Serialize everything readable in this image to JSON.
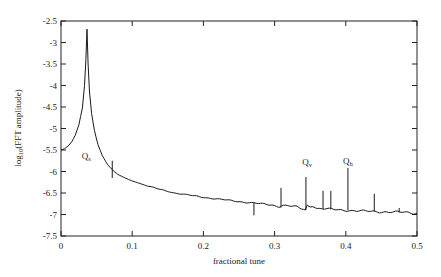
{
  "chart_data": {
    "type": "line",
    "title": "",
    "xlabel": "fractional tune",
    "ylabel": "log10(FFT amplitude)",
    "ylabel_parts": {
      "prefix": "log",
      "sub": "10",
      "suffix": "(FFT amplitude)"
    },
    "xlim": [
      0,
      0.5
    ],
    "ylim": [
      -7.5,
      -2.5
    ],
    "grid": false,
    "legend": null,
    "x_ticks": [
      0,
      0.1,
      0.2,
      0.3,
      0.4,
      0.5
    ],
    "x_tick_labels": [
      "0",
      "0.1",
      "0.2",
      "0.3",
      "0.4",
      "0.5"
    ],
    "y_ticks": [
      -2.5,
      -3,
      -3.5,
      -4,
      -4.5,
      -5,
      -5.5,
      -6,
      -6.5,
      -7,
      -7.5
    ],
    "y_tick_labels": [
      "-2.5",
      "-3",
      "-3.5",
      "-4",
      "-4.5",
      "-5",
      "-5.5",
      "-6",
      "-6.5",
      "-7",
      "-7.5"
    ],
    "series": [
      {
        "name": "FFT spectrum",
        "color": "#1a1a1a",
        "baseline": [
          [
            0,
            -5.5
          ],
          [
            0.005,
            -5.47
          ],
          [
            0.01,
            -5.41
          ],
          [
            0.015,
            -5.31
          ],
          [
            0.02,
            -5.16
          ],
          [
            0.025,
            -4.92
          ],
          [
            0.03,
            -4.52
          ],
          [
            0.033,
            -4.0
          ],
          [
            0.035,
            -3.4
          ],
          [
            0.0365,
            -2.69
          ],
          [
            0.038,
            -3.5
          ],
          [
            0.04,
            -4.15
          ],
          [
            0.043,
            -4.65
          ],
          [
            0.047,
            -5.05
          ],
          [
            0.052,
            -5.38
          ],
          [
            0.058,
            -5.63
          ],
          [
            0.065,
            -5.83
          ],
          [
            0.072,
            -5.96
          ],
          [
            0.08,
            -6.07
          ],
          [
            0.09,
            -6.15
          ],
          [
            0.1,
            -6.22
          ],
          [
            0.12,
            -6.33
          ],
          [
            0.14,
            -6.42
          ],
          [
            0.16,
            -6.5
          ],
          [
            0.18,
            -6.55
          ],
          [
            0.2,
            -6.6
          ],
          [
            0.22,
            -6.64
          ],
          [
            0.25,
            -6.7
          ],
          [
            0.27,
            -6.73
          ],
          [
            0.29,
            -6.77
          ],
          [
            0.308,
            -6.84
          ],
          [
            0.31,
            -6.78
          ],
          [
            0.33,
            -6.82
          ],
          [
            0.343,
            -6.9
          ],
          [
            0.346,
            -6.78
          ],
          [
            0.36,
            -6.86
          ],
          [
            0.38,
            -6.88
          ],
          [
            0.4,
            -6.9
          ],
          [
            0.42,
            -6.92
          ],
          [
            0.44,
            -6.93
          ],
          [
            0.46,
            -6.94
          ],
          [
            0.48,
            -6.95
          ],
          [
            0.5,
            -6.97
          ]
        ],
        "spikes": [
          {
            "x": 0.072,
            "top": -5.75,
            "bottom": -6.15
          },
          {
            "x": 0.271,
            "top": -6.73,
            "bottom": -7.02
          },
          {
            "x": 0.309,
            "top": -6.38,
            "bottom": -6.84
          },
          {
            "x": 0.344,
            "top": -6.13,
            "bottom": -6.9
          },
          {
            "x": 0.368,
            "top": -6.45,
            "bottom": -6.87
          },
          {
            "x": 0.379,
            "top": -6.45,
            "bottom": -6.88
          },
          {
            "x": 0.403,
            "top": -5.92,
            "bottom": -6.9
          },
          {
            "x": 0.44,
            "top": -6.52,
            "bottom": -6.93
          },
          {
            "x": 0.475,
            "top": -6.85,
            "bottom": -6.95
          }
        ]
      }
    ],
    "annotations": [
      {
        "text": "Q",
        "sub": "s",
        "x": 0.029,
        "y": -5.72
      },
      {
        "text": "Q",
        "sub": "v",
        "x": 0.339,
        "y": -5.85
      },
      {
        "text": "Q",
        "sub": "h",
        "x": 0.396,
        "y": -5.82
      }
    ]
  },
  "layout": {
    "plot_left": 61,
    "plot_right": 417,
    "plot_top": 21,
    "plot_bottom": 236
  }
}
